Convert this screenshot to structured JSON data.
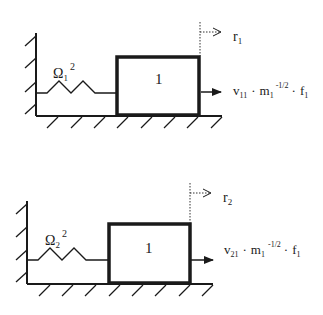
{
  "diagrams": [
    {
      "id": "mode-1",
      "spring_label": {
        "symbol": "Ω",
        "subscript": "1",
        "superscript": "2"
      },
      "mass_label": "1",
      "displacement_label": {
        "symbol": "r",
        "subscript": "1"
      },
      "force_label": {
        "v": "v",
        "v_sub": "11",
        "dot1": "·",
        "m": "m",
        "m_sub": "1",
        "m_sup": "-1/2",
        "dot2": "·",
        "f": "f",
        "f_sub": "1"
      }
    },
    {
      "id": "mode-2",
      "spring_label": {
        "symbol": "Ω",
        "subscript": "2",
        "superscript": "2"
      },
      "mass_label": "1",
      "displacement_label": {
        "symbol": "r",
        "subscript": "2"
      },
      "force_label": {
        "v": "v",
        "v_sub": "21",
        "dot1": "·",
        "m": "m",
        "m_sub": "1",
        "m_sup": "-1/2",
        "dot2": "·",
        "f": "f",
        "f_sub": "1"
      }
    }
  ],
  "colors": {
    "line": "#1a1a1a",
    "background": "#ffffff"
  }
}
